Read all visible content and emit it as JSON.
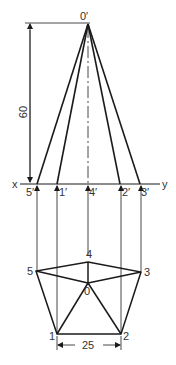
{
  "diagram": {
    "apex_elevation_label": "0′",
    "xy_line": {
      "left": "x",
      "right": "y"
    },
    "elevation_points": [
      "5′",
      "1′",
      "4′",
      "2′",
      "3′"
    ],
    "plan_points": [
      "1",
      "2",
      "3",
      "4",
      "5"
    ],
    "plan_center_label": "0",
    "dimensions": {
      "height": "60",
      "side": "25"
    },
    "colors": {
      "line": "#1a1a1a",
      "text": "#333333",
      "background": "#ffffff"
    }
  }
}
